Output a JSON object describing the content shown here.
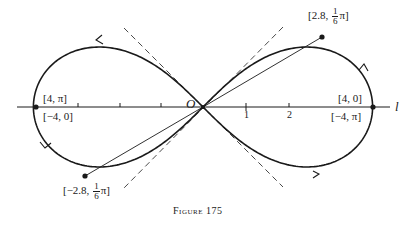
{
  "figure": {
    "caption_word": "Figure",
    "caption_number": "175"
  },
  "axis": {
    "origin_label": "O",
    "axis_label": "l",
    "ticks": [
      "1",
      "2"
    ]
  },
  "points": {
    "right_top": "[4, 0]",
    "right_bottom": "[−4, π]",
    "left_top": "[4, π]",
    "left_bottom": "[−4, 0]",
    "upper_right_prefix": "[2.8, ",
    "upper_right_num": "1",
    "upper_right_den": "6",
    "upper_right_suffix": "π]",
    "lower_left_prefix": "[−2.8, ",
    "lower_left_num": "1",
    "lower_left_den": "6",
    "lower_left_suffix": "π]"
  },
  "colors": {
    "ink": "#1a1a1a",
    "background": "#ffffff"
  }
}
